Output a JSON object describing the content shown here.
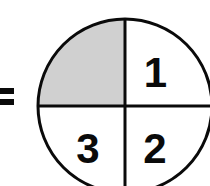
{
  "figure": {
    "kind": "fraction-circle-diagram",
    "background_color": "#ffffff",
    "stroke_color": "#0a0a0a",
    "shaded_color": "#d0d0d0",
    "unshaded_color": "#ffffff"
  },
  "equals_sign": {
    "symbol": "=",
    "clipped": "left"
  },
  "circle": {
    "center_x": 125,
    "center_y": 106,
    "radius": 87,
    "divisions": 4,
    "shaded_count": 1
  },
  "quadrants": [
    {
      "position": "upper-left",
      "label": "",
      "shaded": "true",
      "fill": "#d0d0d0"
    },
    {
      "position": "upper-right",
      "label": "1",
      "shaded": "false",
      "fill": "#ffffff"
    },
    {
      "position": "lower-right",
      "label": "2",
      "shaded": "false",
      "fill": "#ffffff"
    },
    {
      "position": "lower-left",
      "label": "3",
      "shaded": "false",
      "fill": "#ffffff"
    }
  ]
}
